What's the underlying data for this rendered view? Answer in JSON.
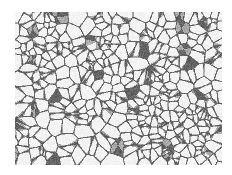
{
  "image": {
    "subject": "grain-boundary micrograph",
    "region": {
      "x": 15,
      "y": 12,
      "width": 207,
      "height": 153
    },
    "colors": {
      "background": "#ffffff",
      "grain_fill": "#f2f2f2",
      "boundary": "#5a5a5a"
    },
    "grain_count_approx": 420
  }
}
